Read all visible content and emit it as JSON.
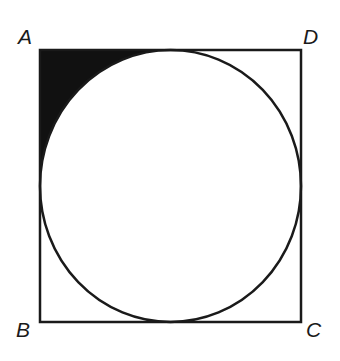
{
  "diagram": {
    "type": "square with inscribed circle, shaded corner region",
    "vertices": [
      {
        "label": "A",
        "position": "top-left"
      },
      {
        "label": "D",
        "position": "top-right"
      },
      {
        "label": "C",
        "position": "bottom-right"
      },
      {
        "label": "B",
        "position": "bottom-left"
      }
    ],
    "shaded_region": "region between corner A and the inscribed circle",
    "colors": {
      "stroke": "#1a1a1a",
      "fill_shaded": "#111111",
      "background": "#ffffff"
    }
  }
}
